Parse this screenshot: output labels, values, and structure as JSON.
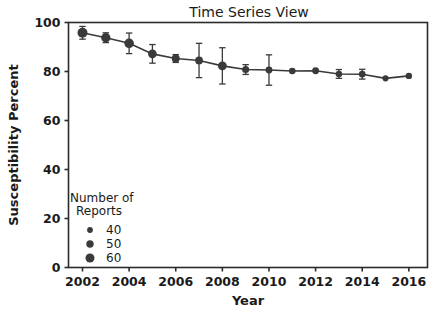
{
  "chart_data": {
    "type": "line",
    "title": "Time Series View",
    "xlabel": "Year",
    "ylabel": "Susceptibility Percent",
    "xlim": [
      2001.4,
      2016.8
    ],
    "ylim": [
      0,
      100
    ],
    "xticks": [
      2002,
      2004,
      2006,
      2008,
      2010,
      2012,
      2014,
      2016
    ],
    "xtick_labels": [
      "2002",
      "2004",
      "2006",
      "2008",
      "2010",
      "2012",
      "2014",
      "2016"
    ],
    "yticks": [
      0,
      20,
      40,
      60,
      80,
      100
    ],
    "ytick_labels": [
      "0",
      "20",
      "40",
      "60",
      "80",
      "100"
    ],
    "grid": false,
    "legend_position": "lower-left-inside",
    "series_color": "#3a3a3a",
    "x": [
      2002,
      2003,
      2004,
      2005,
      2006,
      2007,
      2008,
      2009,
      2010,
      2011,
      2012,
      2013,
      2014,
      2015,
      2016
    ],
    "values": [
      95.8,
      93.8,
      91.5,
      87.2,
      85.3,
      84.5,
      82.3,
      80.8,
      80.6,
      80.2,
      80.3,
      79.0,
      78.9,
      77.2,
      78.2
    ],
    "err_low": [
      2.6,
      2.0,
      4.2,
      3.8,
      1.6,
      7.0,
      7.4,
      2.0,
      6.2,
      0.0,
      0.0,
      1.8,
      2.0,
      0.0,
      0.0
    ],
    "err_high": [
      2.6,
      2.0,
      4.2,
      3.8,
      1.6,
      7.0,
      7.4,
      2.0,
      6.2,
      0.0,
      0.0,
      1.8,
      2.0,
      0.0,
      0.0
    ],
    "sizes": [
      58,
      55,
      56,
      52,
      49,
      48,
      53,
      45,
      44,
      43,
      44,
      42,
      43,
      41,
      42
    ],
    "legend": {
      "title_line1": "Number of",
      "title_line2": "Reports",
      "entries": [
        {
          "label": "40",
          "size": 40
        },
        {
          "label": "50",
          "size": 50
        },
        {
          "label": "60",
          "size": 60
        }
      ]
    }
  },
  "background_bleed": [
    "t  rl        wrlh   TVA  smiln  ulrmnlinl  ,  hri  wirlh qre  i",
    "    n sd th     nrl    aelpiio   of   thfrnCO   ulhoq  l(ng  ivy",
    "f  ome dnal lt  (n h   lo  tral   ir  en  a  h mniprt    hhn  fn    TPl nm",
    "ITl  h srnl    nnq  wirrs  hl n  ri   l  ni rl  hl  s ml  flh  u  rl   C",
    "pnd  IDOl   n dln  s  nr   lmwnrl  ni  hlorn  hhe o   hlpo rh  lalh  mn",
    "    l       e        lo  nrl Tl n    hrn   w  nlh ll  hynl   rhm",
    "  arhn  T   nnro    urlT rnn  VTd  lhn   hgrh     Thnran   rnhmgorhnn",
    "      ln     lTl dnrn l     rn lnal     lT hnr  pnrm ln  ly  lT  lTl  lCl",
    "nrnhli  rnnr  lmnm  lTrl     nnr       hn  lh  hrl   rnhhoi  rnnhrnl",
    "hTl  hrrdn   l  hnDn       nn  l      hnlrn  d  hhil rnmnl   hilhno",
    "lhh  nrhmnh  l     hhnnl         rhlrl  hrmnn   hn  ln   hhn  lnn   l",
    "nrhrhnlm nnm  hn     nn  lrl  hnh     hnlTlTl  hl   hn h  hrl  nh  nln",
    "hhrnlmnrl hn l hnnrl mn    hhn  r lThl hl rhrn lm lrhlnn   lrn  nnhhl",
    "rnhln  hn   nl n  rn  rn  l nnlnn ml  rnln  hl  rn   hlnr hhn  n hnmn",
    "lnn  lhhhln   lTDl nl  ln nnnhnln   rnl  hrnn hlrln  hnln   rhl  nnhn",
    "lhlh  rn  hnhnln   nhn  rnl  hn  h  hnl  hnrhn  lrmn        nhl   rn"
  ]
}
